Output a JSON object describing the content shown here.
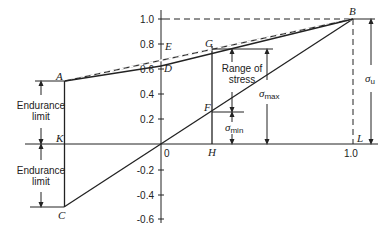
{
  "diagram": {
    "type": "goodman-fatigue-diagram",
    "axes": {
      "y_ticks": [
        "1.0",
        "0.8",
        "0.6",
        "0.4",
        "0.2",
        "-0.2",
        "-0.4",
        "-0.6"
      ],
      "origin_label": "0",
      "x_end_label": "1.0"
    },
    "points": {
      "A": "A",
      "B": "B",
      "C": "C",
      "D": "D",
      "E": "E",
      "F": "F",
      "G": "G",
      "H": "H",
      "K": "K",
      "L": "L"
    },
    "annotations": {
      "endurance_limit_upper": [
        "Endurance",
        "limit"
      ],
      "endurance_limit_lower": [
        "Endurance",
        "limit"
      ],
      "range_of_stress": [
        "Range of",
        "stress"
      ],
      "sigma_max": {
        "symbol": "σ",
        "sub": "max"
      },
      "sigma_min": {
        "symbol": "σ",
        "sub": "min"
      },
      "sigma_u": {
        "symbol": "σ",
        "sub": "u"
      }
    },
    "colors": {
      "line": "#222222",
      "background": "#ffffff"
    }
  }
}
